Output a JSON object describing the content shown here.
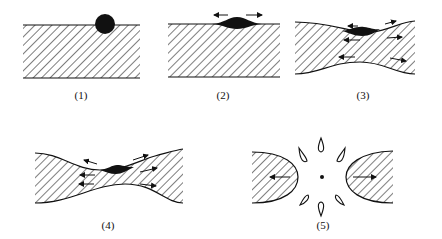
{
  "figure": {
    "colors": {
      "ink": "#111111",
      "background": "#ffffff"
    },
    "panels": [
      {
        "id": 1,
        "label": "(1)",
        "content": "drop sitting on flat hatched layer"
      },
      {
        "id": 2,
        "label": "(2)",
        "content": "drop spreading into lens, arrows outward"
      },
      {
        "id": 3,
        "label": "(3)",
        "content": "layer thinning with curved surfaces, internal flow arrows"
      },
      {
        "id": 4,
        "label": "(4)",
        "content": "further necking of layer, flow arrows"
      },
      {
        "id": 5,
        "label": "(5)",
        "content": "sheet ruptured: two retracting rims and ring of droplets around center point"
      }
    ]
  }
}
